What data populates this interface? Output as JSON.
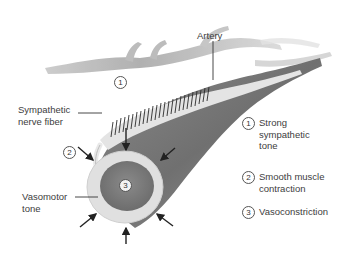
{
  "labels": {
    "artery": "Artery",
    "sympathetic_nerve_fiber_line1": "Sympathetic",
    "sympathetic_nerve_fiber_line2": "nerve fiber",
    "vasomotor_tone_line1": "Vasomotor",
    "vasomotor_tone_line2": "tone"
  },
  "markers": {
    "m1": "1",
    "m2": "2",
    "m3": "3"
  },
  "legend": [
    {
      "num": "1",
      "line1": "Strong",
      "line2": "sympathetic",
      "line3": "tone"
    },
    {
      "num": "2",
      "line1": "Smooth muscle",
      "line2": "contraction"
    },
    {
      "num": "3",
      "line1": "Vasoconstriction"
    }
  ],
  "colors": {
    "artery_dark": "#6e6e6e",
    "artery_mid": "#8c8c8c",
    "wall_light": "#e2e2e2",
    "lumen": "#7a7a7a",
    "branch": "#b0b0b0",
    "arrow": "#222222"
  }
}
